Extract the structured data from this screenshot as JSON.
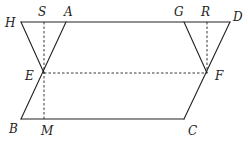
{
  "diagram": {
    "points": {
      "H": "H",
      "S": "S",
      "A": "A",
      "G": "G",
      "R": "R",
      "D": "D",
      "E": "E",
      "F": "F",
      "B": "B",
      "M": "M",
      "C": "C"
    },
    "solid_segments": [
      "HD",
      "AB",
      "DC",
      "BC",
      "HE",
      "GF"
    ],
    "dashed_segments": [
      "SM",
      "RF",
      "EF"
    ]
  }
}
